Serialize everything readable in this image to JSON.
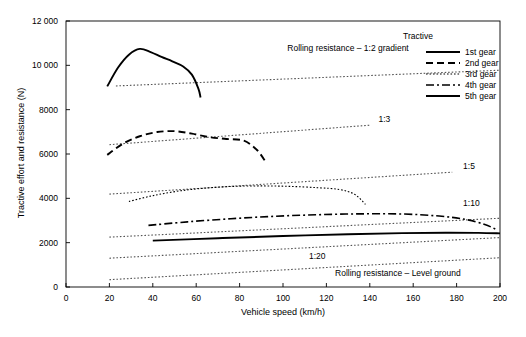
{
  "chart_data": {
    "type": "line",
    "title": "",
    "xlabel": "Vehicle speed (km/h)",
    "ylabel": "Tractive effort and resistance (N)",
    "xlim": [
      0,
      200
    ],
    "ylim": [
      0,
      12000
    ],
    "xticks": [
      0,
      20,
      40,
      60,
      80,
      100,
      120,
      140,
      160,
      180,
      200
    ],
    "yticks": [
      0,
      2000,
      4000,
      6000,
      8000,
      10000,
      12000
    ],
    "ytick_labels": [
      "0",
      "2000",
      "4000",
      "6000",
      "8000",
      "10 000",
      "12 000"
    ],
    "xtick_labels": [
      "0",
      "20",
      "40",
      "60",
      "80",
      "100",
      "120",
      "140",
      "160",
      "180",
      "200"
    ],
    "grid": false,
    "legend_position": "upper right",
    "legend_title": "Tractive",
    "series": [
      {
        "name": "1st gear",
        "style": "solid",
        "x": [
          19,
          24,
          29,
          34,
          39,
          44,
          49,
          54,
          58,
          61,
          62
        ],
        "y": [
          9050,
          9900,
          10480,
          10740,
          10600,
          10380,
          10180,
          9950,
          9580,
          8950,
          8550
        ]
      },
      {
        "name": "2nd gear",
        "style": "dashed",
        "x": [
          19,
          26,
          34,
          42,
          50,
          58,
          66,
          74,
          82,
          88,
          92
        ],
        "y": [
          5960,
          6450,
          6800,
          6990,
          7030,
          6920,
          6760,
          6680,
          6600,
          6180,
          5650
        ]
      },
      {
        "name": "3rd gear",
        "style": "dotted",
        "x": [
          29,
          40,
          52,
          64,
          77,
          90,
          103,
          116,
          126,
          133,
          138
        ],
        "y": [
          3860,
          4120,
          4330,
          4460,
          4540,
          4560,
          4540,
          4480,
          4400,
          4180,
          3730
        ]
      },
      {
        "name": "4th gear",
        "style": "dashdot",
        "x": [
          38,
          56,
          76,
          96,
          116,
          136,
          156,
          172,
          184,
          193,
          199
        ],
        "y": [
          2780,
          2940,
          3080,
          3190,
          3260,
          3300,
          3290,
          3200,
          3050,
          2820,
          2560
        ]
      },
      {
        "name": "5th gear",
        "style": "solid",
        "x": [
          40,
          70,
          100,
          130,
          155,
          175,
          190,
          200
        ],
        "y": [
          2090,
          2200,
          2300,
          2380,
          2430,
          2450,
          2440,
          2420
        ]
      }
    ],
    "resistance_lines": [
      {
        "name": "Rolling resistance – 1:2 gradient",
        "style": "dotted",
        "x": [
          23,
          200
        ],
        "y": [
          9070,
          9780
        ],
        "label": "Rolling resistance – 1:2 gradient"
      },
      {
        "name": "1:3 gradient",
        "style": "dotted",
        "x": [
          20,
          140
        ],
        "y": [
          6420,
          7300
        ],
        "label": "1:3"
      },
      {
        "name": "1:5 gradient",
        "style": "dotted",
        "x": [
          20,
          178
        ],
        "y": [
          4190,
          5180
        ],
        "label": "1:5"
      },
      {
        "name": "1:10 gradient",
        "style": "dotted",
        "x": [
          20,
          200
        ],
        "y": [
          2250,
          3100
        ],
        "label": "1:10"
      },
      {
        "name": "1:20 gradient",
        "style": "dotted",
        "x": [
          20,
          200
        ],
        "y": [
          1300,
          2230
        ],
        "label": "1:20"
      },
      {
        "name": "Rolling resistance – Level ground",
        "style": "dotted",
        "x": [
          20,
          200
        ],
        "y": [
          330,
          1320
        ],
        "label": "Rolling resistance – Level ground"
      }
    ],
    "annotations": [
      {
        "text": "Rolling resistance – 1:2 gradient",
        "x": 102,
        "y": 10770
      },
      {
        "text": "1:3",
        "x": 144,
        "y": 7570
      },
      {
        "text": "1:5",
        "x": 183,
        "y": 5470
      },
      {
        "text": "1:10",
        "x": 183,
        "y": 3810
      },
      {
        "text": "1:20",
        "x": 112,
        "y": 1380
      },
      {
        "text": "Rolling resistance – Level ground",
        "x": 124,
        "y": 640
      }
    ]
  },
  "axes": {
    "y_title": "Tractive effort and resistance (N)",
    "x_title": "Vehicle speed (km/h)"
  },
  "legend": {
    "title": "Tractive",
    "items": [
      {
        "label": "1st gear",
        "style": "solid"
      },
      {
        "label": "2nd gear",
        "style": "dashed"
      },
      {
        "label": "3rd gear",
        "style": "dotted"
      },
      {
        "label": "4th gear",
        "style": "dashdot"
      },
      {
        "label": "5th gear",
        "style": "solid"
      }
    ]
  },
  "caption": {
    "text": ""
  },
  "colors": {
    "line": "#000000",
    "axis": "#000000",
    "resistance": "#555555",
    "background": "#ffffff"
  }
}
